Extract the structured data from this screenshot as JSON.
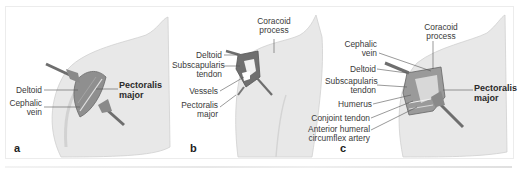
{
  "figure": {
    "panels": [
      {
        "id": "a",
        "panel_label": "a",
        "labels": {
          "deltoid": "Deltoid",
          "cephalic_vein_1": "Cephalic",
          "cephalic_vein_2": "vein",
          "pectoralis_major_1": "Pectoralis",
          "pectoralis_major_2": "major"
        }
      },
      {
        "id": "b",
        "panel_label": "b",
        "labels": {
          "coracoid_process_1": "Coracoid",
          "coracoid_process_2": "process",
          "deltoid": "Deltoid",
          "subscapularis_tendon_1": "Subscapularis",
          "subscapularis_tendon_2": "tendon",
          "vessels": "Vessels",
          "pectoralis_major_1": "Pectoralis",
          "pectoralis_major_2": "major"
        }
      },
      {
        "id": "c",
        "panel_label": "c",
        "labels": {
          "coracoid_process_1": "Coracoid",
          "coracoid_process_2": "process",
          "cephalic_vein_1": "Cephalic",
          "cephalic_vein_2": "vein",
          "deltoid": "Deltoid",
          "subscapularis_tendon_1": "Subscapularis",
          "subscapularis_tendon_2": "tendon",
          "humerus": "Humerus",
          "conjoint_tendon": "Conjoint tendon",
          "anterior_humeral_1": "Anterior humeral",
          "anterior_humeral_2": "circumflex artery",
          "pectoralis_major_1": "Pectoralis",
          "pectoralis_major_2": "major"
        }
      }
    ],
    "colors": {
      "skin": "#e6e6e6",
      "skin_shadow": "#cfcfcf",
      "incision": "#8a8a8a",
      "retractor": "#6e6e6e",
      "leader_line": "#555555"
    }
  }
}
